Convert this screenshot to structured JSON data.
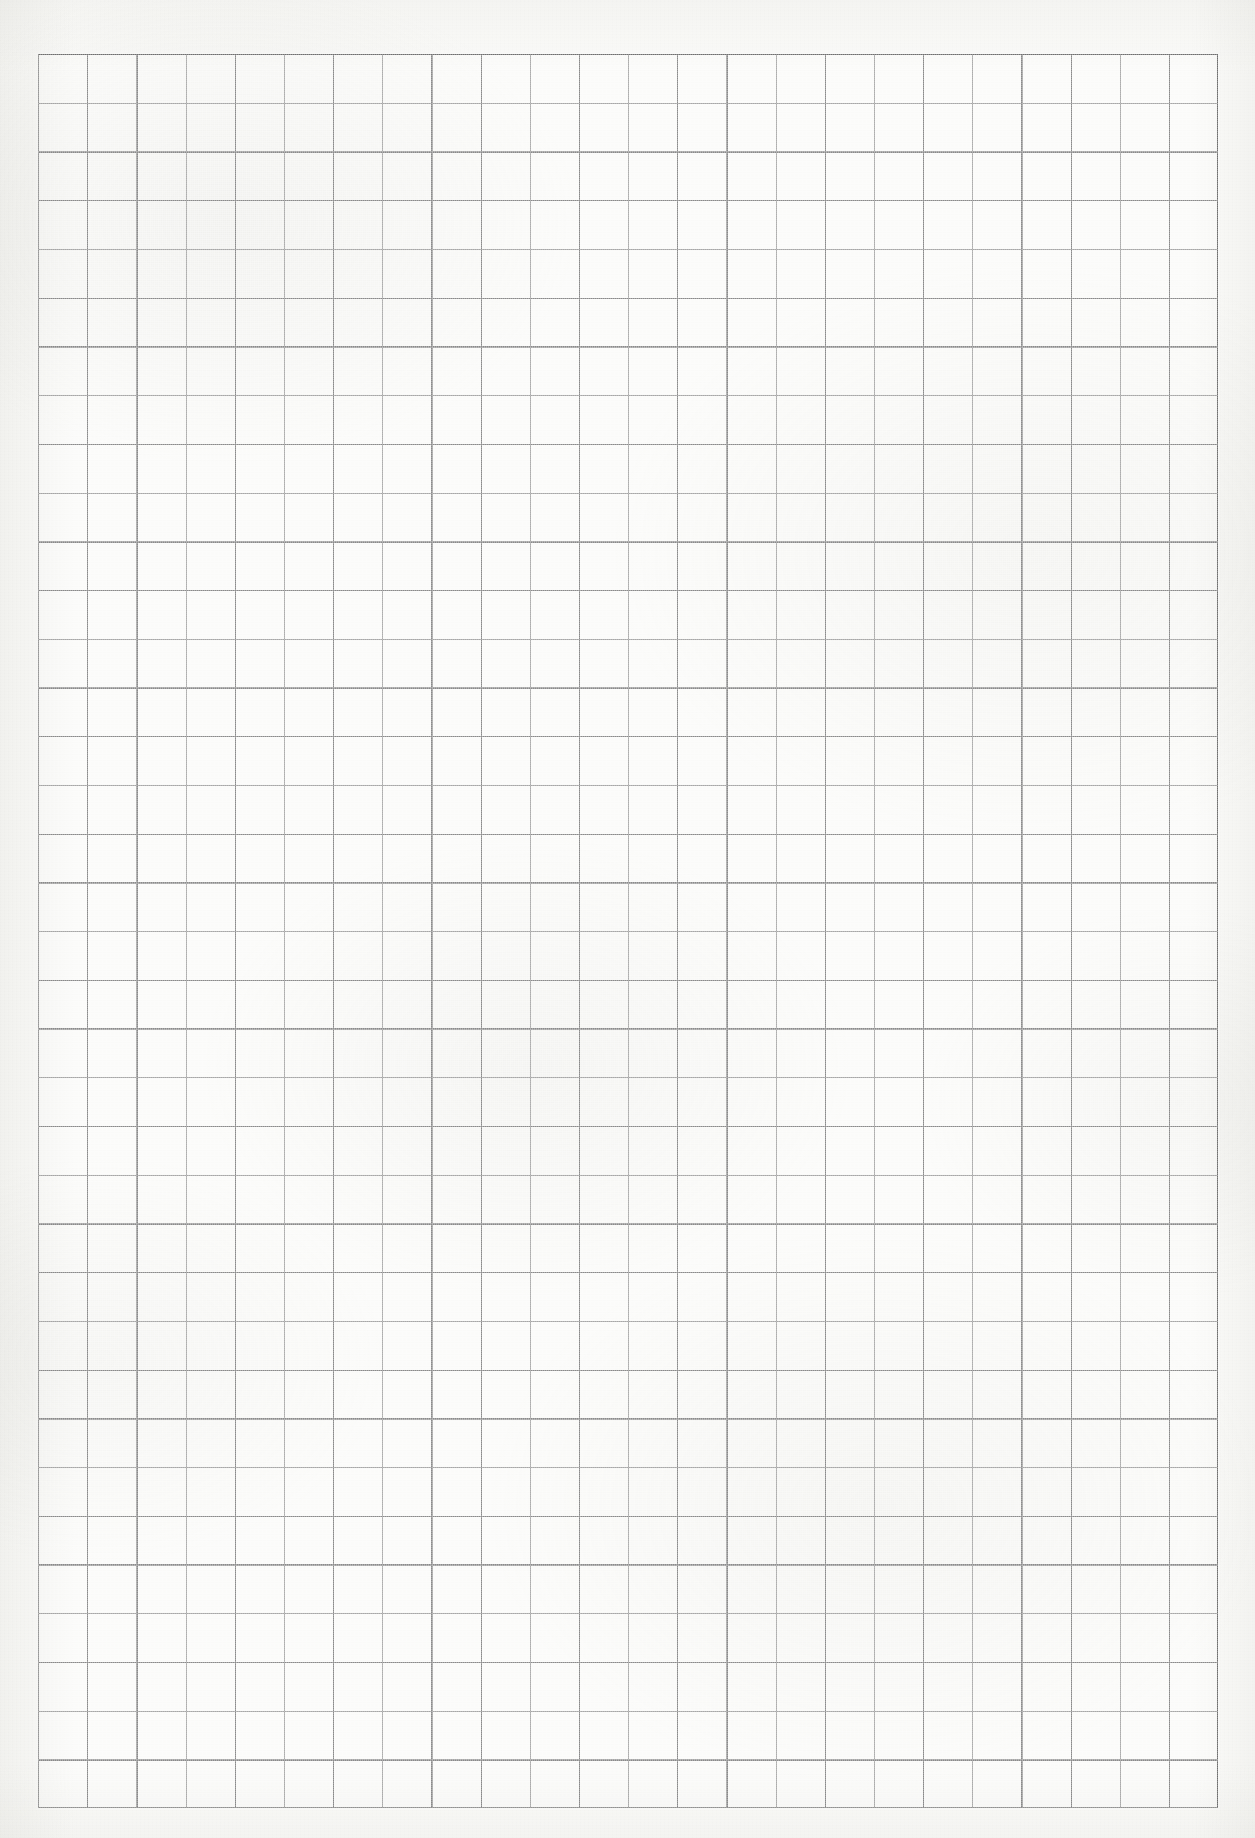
{
  "document": {
    "kind": "scanned-grid-paper",
    "page_width": 1255,
    "page_height": 1838,
    "page_background_color": "#fbfbf9",
    "content_text": "",
    "notes_text": ""
  },
  "heading": {
    "text": "Appendix",
    "visible_fragment": "descender stems only (heading cropped off top edge)",
    "color": "#1a1a1a",
    "left": 122,
    "top": -17,
    "font_size": 23,
    "clip_height": 9,
    "clip_width": 62
  },
  "grid": {
    "label": "graph-paper-grid",
    "left": 38,
    "top": 54,
    "width": 1180,
    "height": 1754,
    "columns": 24,
    "rows": 36,
    "cell_width": 49.17,
    "cell_height": 48.72,
    "line_color": "#8a8a8a",
    "edge_line_color": "#6f6f6f",
    "line_width": 1.3,
    "is_empty": true,
    "cells_filled": 0
  },
  "chart_data": {
    "type": "table",
    "title": "",
    "xlabel": "",
    "ylabel": "",
    "categories": [],
    "values": [],
    "grid": true,
    "legend": "none",
    "columns": 24,
    "rows": 36,
    "cell_values": []
  }
}
